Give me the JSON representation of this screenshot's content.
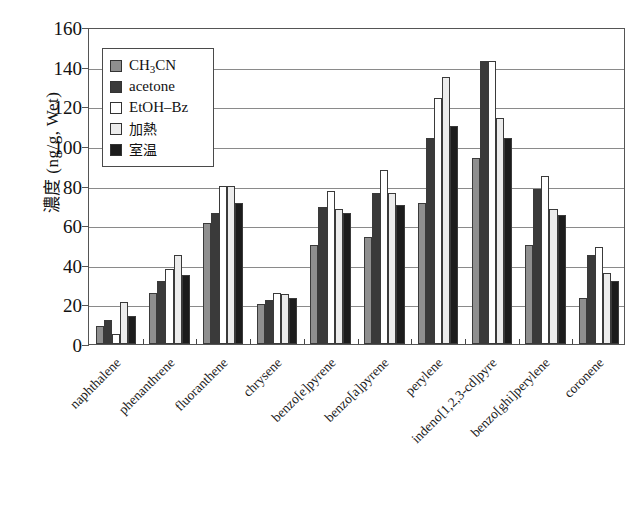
{
  "chart_data": {
    "type": "bar",
    "title": "",
    "xlabel": "",
    "ylabel": "濃度 (ng/g, Wet)",
    "ylim": [
      0,
      160
    ],
    "ytick_step": 20,
    "yticks": [
      "0",
      "20",
      "40",
      "60",
      "80",
      "100",
      "120",
      "140",
      "160"
    ],
    "grid": "horizontal",
    "legend_position": "upper-left-inside",
    "categories": [
      "naphthalene",
      "phenanthrene",
      "fluoranthene",
      "chrysene",
      "benzo[e]pyrene",
      "benzo[a]pyrene",
      "perylene",
      "indeno[1,2,3-cd]pyre",
      "benzo[ghi]perylene",
      "coronene"
    ],
    "series": [
      {
        "name": "CH3CN",
        "label_html": "CH<sub>3</sub>CN",
        "color": "#8f8f8f",
        "values": [
          9,
          26,
          61,
          20,
          50,
          54,
          71,
          94,
          50,
          23
        ]
      },
      {
        "name": "acetone",
        "label_html": "acetone",
        "color": "#3a3a3a",
        "values": [
          12,
          32,
          66,
          22,
          69,
          76,
          104,
          143,
          78,
          45
        ]
      },
      {
        "name": "EtOH-Bz",
        "label_html": "EtOH–Bz",
        "color": "#ffffff",
        "values": [
          5,
          38,
          80,
          26,
          77,
          88,
          124,
          143,
          85,
          49
        ]
      },
      {
        "name": "加熱",
        "label_html": "加熱",
        "color": "#ececec",
        "values": [
          21,
          45,
          80,
          25,
          68,
          76,
          135,
          114,
          68,
          36
        ]
      },
      {
        "name": "室温",
        "label_html": "室温",
        "color": "#1c1c1c",
        "values": [
          14,
          35,
          71,
          23,
          66,
          70,
          110,
          104,
          65,
          32
        ]
      }
    ]
  },
  "legend": {
    "entries": [
      {
        "label": "CH3CN",
        "swatch": "#8f8f8f"
      },
      {
        "label": "acetone",
        "swatch": "#3a3a3a"
      },
      {
        "label": "EtOH-Bz",
        "swatch": "#ffffff"
      },
      {
        "label": "加熱",
        "swatch": "#ececec"
      },
      {
        "label": "室温",
        "swatch": "#1c1c1c"
      }
    ]
  }
}
